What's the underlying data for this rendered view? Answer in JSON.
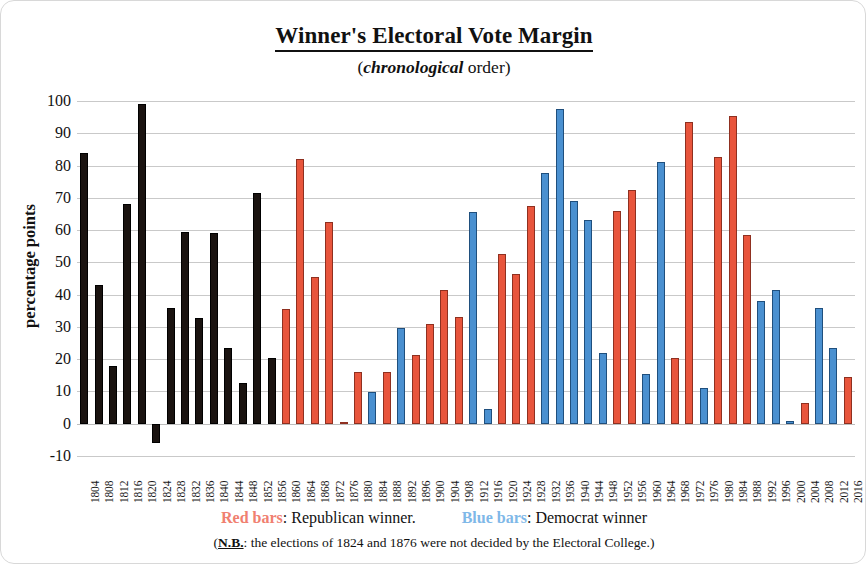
{
  "chart_data": {
    "type": "bar",
    "title": "Winner's Electoral Vote Margin",
    "subtitle_italic": "chronological",
    "subtitle_rest": " order)",
    "subtitle_open": "(",
    "xlabel": "",
    "ylabel": "percentage points",
    "ylim": [
      -10,
      100
    ],
    "ytick_step": 10,
    "yticks": [
      100,
      90,
      80,
      70,
      60,
      50,
      40,
      30,
      20,
      10,
      0,
      -10
    ],
    "grid": true,
    "legend_position": "bottom",
    "categories": [
      "1804",
      "1808",
      "1812",
      "1816",
      "1820",
      "1824",
      "1828",
      "1832",
      "1836",
      "1840",
      "1844",
      "1848",
      "1852",
      "1856",
      "1860",
      "1864",
      "1868",
      "1872",
      "1876",
      "1880",
      "1884",
      "1888",
      "1892",
      "1896",
      "1900",
      "1904",
      "1908",
      "1912",
      "1916",
      "1920",
      "1924",
      "1928",
      "1932",
      "1936",
      "1940",
      "1944",
      "1948",
      "1952",
      "1956",
      "1960",
      "1964",
      "1968",
      "1972",
      "1976",
      "1980",
      "1984",
      "1988",
      "1992",
      "1996",
      "2000",
      "2004",
      "2008",
      "2012",
      "2016"
    ],
    "values": [
      84,
      43,
      18,
      68,
      99,
      -6,
      36,
      59.5,
      32.8,
      59,
      23.5,
      12.5,
      71.5,
      20.5,
      35.5,
      82,
      45.5,
      62.5,
      0.5,
      16,
      9.8,
      16,
      29.6,
      21.3,
      30.8,
      41.5,
      33,
      65.5,
      4.5,
      52.5,
      46.5,
      67.5,
      77.8,
      97.5,
      69,
      63,
      21.8,
      66,
      72.5,
      15.5,
      81,
      20.5,
      93.5,
      11,
      82.5,
      95.5,
      58.5,
      38,
      41.5,
      0.8,
      6.5,
      36,
      23.5,
      14.5
    ],
    "bar_colors": [
      "black",
      "black",
      "black",
      "black",
      "black",
      "black",
      "black",
      "black",
      "black",
      "black",
      "black",
      "black",
      "black",
      "black",
      "red",
      "red",
      "red",
      "red",
      "red",
      "red",
      "blue",
      "red",
      "blue",
      "red",
      "red",
      "red",
      "red",
      "blue",
      "blue",
      "red",
      "red",
      "red",
      "blue",
      "blue",
      "blue",
      "blue",
      "blue",
      "red",
      "red",
      "blue",
      "blue",
      "red",
      "red",
      "blue",
      "red",
      "red",
      "red",
      "blue",
      "blue",
      "blue",
      "red",
      "blue",
      "blue",
      "red"
    ],
    "colors": {
      "red": "#e8553c",
      "blue": "#4a90d0",
      "black": "#1a1310",
      "grid": "#c9c9c9"
    },
    "legend": [
      {
        "swatch_label": "Red bars",
        "text": ":  Republican winner.",
        "color": "#f08070"
      },
      {
        "swatch_label": "Blue bars",
        "text": ":  Democrat winner",
        "color": "#7fb8e8"
      }
    ],
    "note_tag": "N.B.",
    "note_text": ": the elections of 1824 and 1876 were not decided by the Electoral College.)",
    "note_open": "("
  }
}
